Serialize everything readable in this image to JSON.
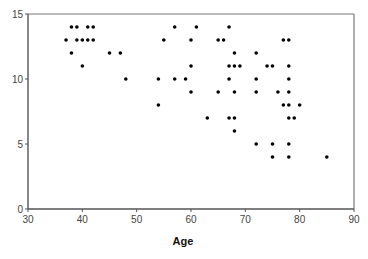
{
  "chart_data": {
    "type": "scatter",
    "title": "",
    "xlabel": "Age",
    "ylabel": "",
    "xlim": [
      30,
      90
    ],
    "ylim": [
      0,
      15
    ],
    "xticks": [
      30,
      40,
      50,
      60,
      70,
      80,
      90
    ],
    "yticks": [
      0,
      5,
      10,
      15
    ],
    "grid": false,
    "legend": null,
    "marker_color": "#000000",
    "series": [
      {
        "name": "points",
        "points": [
          [
            38,
            14
          ],
          [
            39,
            14
          ],
          [
            41,
            14
          ],
          [
            42,
            14
          ],
          [
            57,
            14
          ],
          [
            61,
            14
          ],
          [
            67,
            14
          ],
          [
            37,
            13
          ],
          [
            39,
            13
          ],
          [
            40,
            13
          ],
          [
            41,
            13
          ],
          [
            42,
            13
          ],
          [
            55,
            13
          ],
          [
            60,
            13
          ],
          [
            65,
            13
          ],
          [
            66,
            13
          ],
          [
            77,
            13
          ],
          [
            78,
            13
          ],
          [
            38,
            12
          ],
          [
            45,
            12
          ],
          [
            47,
            12
          ],
          [
            68,
            12
          ],
          [
            72,
            12
          ],
          [
            40,
            11
          ],
          [
            60,
            11
          ],
          [
            67,
            11
          ],
          [
            68,
            11
          ],
          [
            69,
            11
          ],
          [
            74,
            11
          ],
          [
            75,
            11
          ],
          [
            78,
            11
          ],
          [
            48,
            10
          ],
          [
            54,
            10
          ],
          [
            57,
            10
          ],
          [
            59,
            10
          ],
          [
            67,
            10
          ],
          [
            72,
            10
          ],
          [
            78,
            10
          ],
          [
            60,
            9
          ],
          [
            65,
            9
          ],
          [
            68,
            9
          ],
          [
            72,
            9
          ],
          [
            76,
            9
          ],
          [
            78,
            9
          ],
          [
            54,
            8
          ],
          [
            77,
            8
          ],
          [
            78,
            8
          ],
          [
            80,
            8
          ],
          [
            63,
            7
          ],
          [
            67,
            7
          ],
          [
            68,
            7
          ],
          [
            78,
            7
          ],
          [
            79,
            7
          ],
          [
            68,
            6
          ],
          [
            72,
            5
          ],
          [
            75,
            5
          ],
          [
            78,
            5
          ],
          [
            75,
            4
          ],
          [
            78,
            4
          ],
          [
            85,
            4
          ]
        ]
      }
    ]
  }
}
